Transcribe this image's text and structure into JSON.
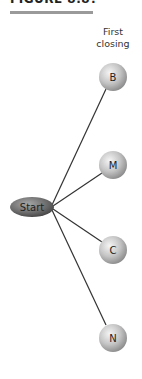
{
  "figure": {
    "title": "FIGURE 8.8?",
    "column_label_line1": "First",
    "column_label_line2": "closing"
  },
  "diagram": {
    "root": {
      "label": "Start",
      "x": 32,
      "y": 207
    },
    "nodes": [
      {
        "label": "B",
        "x": 113,
        "y": 77
      },
      {
        "label": "M",
        "x": 113,
        "y": 165
      },
      {
        "label": "C",
        "x": 113,
        "y": 250
      },
      {
        "label": "N",
        "x": 113,
        "y": 338
      }
    ]
  },
  "colors": {
    "edge": "#333333",
    "node_light": "#f2f2f2",
    "node_dark": "#8a8a8a",
    "root_light": "#9a9a9a",
    "root_dark": "#3a3a3a",
    "title_bar": "#9a9a9a"
  }
}
